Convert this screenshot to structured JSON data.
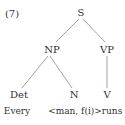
{
  "example_number": "(7)",
  "tree": {
    "root": "S",
    "np": "NP",
    "vp": "VP",
    "det": "Det",
    "n": "N",
    "v": "V"
  },
  "words": {
    "det": "Every",
    "n": "<man, f(i)>",
    "v": "runs"
  },
  "colors": {
    "line": "#888888",
    "text": "#333333"
  }
}
